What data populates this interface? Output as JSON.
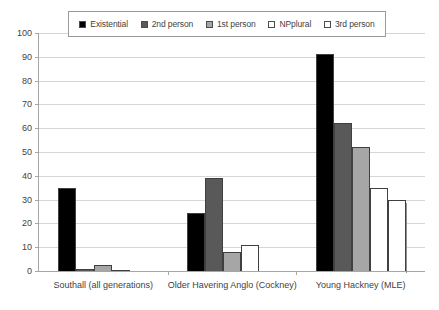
{
  "chart_data": {
    "type": "bar",
    "title": "",
    "xlabel": "",
    "ylabel": "",
    "ylim": [
      0,
      100
    ],
    "ytick_step": 10,
    "yticks": [
      100,
      90,
      80,
      70,
      60,
      50,
      40,
      30,
      20,
      10,
      0
    ],
    "grid": true,
    "legend_position": "top",
    "categories": [
      "Southall (all generations)",
      "Older Havering Anglo (Cockney)",
      "Young Hackney (MLE)"
    ],
    "series": [
      {
        "name": "Existential",
        "color": "#000000",
        "values": [
          35,
          24.5,
          91
        ]
      },
      {
        "name": "2nd person",
        "color": "#595959",
        "values": [
          1,
          39,
          62
        ]
      },
      {
        "name": "1st person",
        "color": "#a6a6a6",
        "values": [
          2.5,
          8,
          52
        ]
      },
      {
        "name": "NPplural",
        "color": "#ffffff",
        "values": [
          0.5,
          11,
          35
        ]
      },
      {
        "name": "3rd person",
        "color": "#ffffff",
        "values": [
          0,
          0,
          30
        ]
      }
    ]
  },
  "legend": {
    "items": [
      {
        "label": "Existential",
        "color": "#000000"
      },
      {
        "label": "2nd person",
        "color": "#595959"
      },
      {
        "label": "1st person",
        "color": "#a6a6a6"
      },
      {
        "label": "NPplural",
        "color": "#ffffff"
      },
      {
        "label": "3rd person",
        "color": "#ffffff"
      }
    ]
  }
}
